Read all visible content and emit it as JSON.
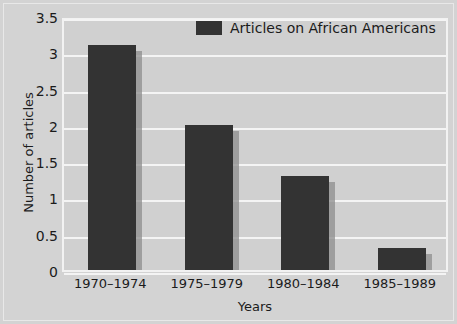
{
  "chart_data": {
    "type": "bar",
    "title": "",
    "categories": [
      "1970–1974",
      "1975–1979",
      "1980–1984",
      "1985–1989"
    ],
    "values": [
      3.1,
      2.0,
      1.3,
      0.3
    ],
    "series": [
      {
        "name": "Articles on African Americans",
        "values": [
          3.1,
          2.0,
          1.3,
          0.3
        ]
      }
    ],
    "xlabel": "Years",
    "ylabel": "Number of articles",
    "ylim": [
      0,
      3.5
    ],
    "yticks": [
      "0",
      "0.5",
      "1",
      "1.5",
      "2",
      "2.5",
      "3",
      "3.5"
    ],
    "ytick_values": [
      0,
      0.5,
      1,
      1.5,
      2,
      2.5,
      3,
      3.5
    ],
    "grid": true,
    "legend_position": "top-center",
    "legend": [
      "Articles on African Americans"
    ]
  },
  "legend": {
    "label": "Articles on African Americans",
    "swatch_color": "#333333"
  },
  "axes": {
    "x_title": "Years",
    "y_title": "Number of articles"
  },
  "colors": {
    "bar": "#333333",
    "bar_shadow": "#8e8e8e",
    "background": "#d3d3d3",
    "plot_background": "#d0d0d0",
    "gridline": "#f4f4f4",
    "text": "#1b1b1b"
  }
}
